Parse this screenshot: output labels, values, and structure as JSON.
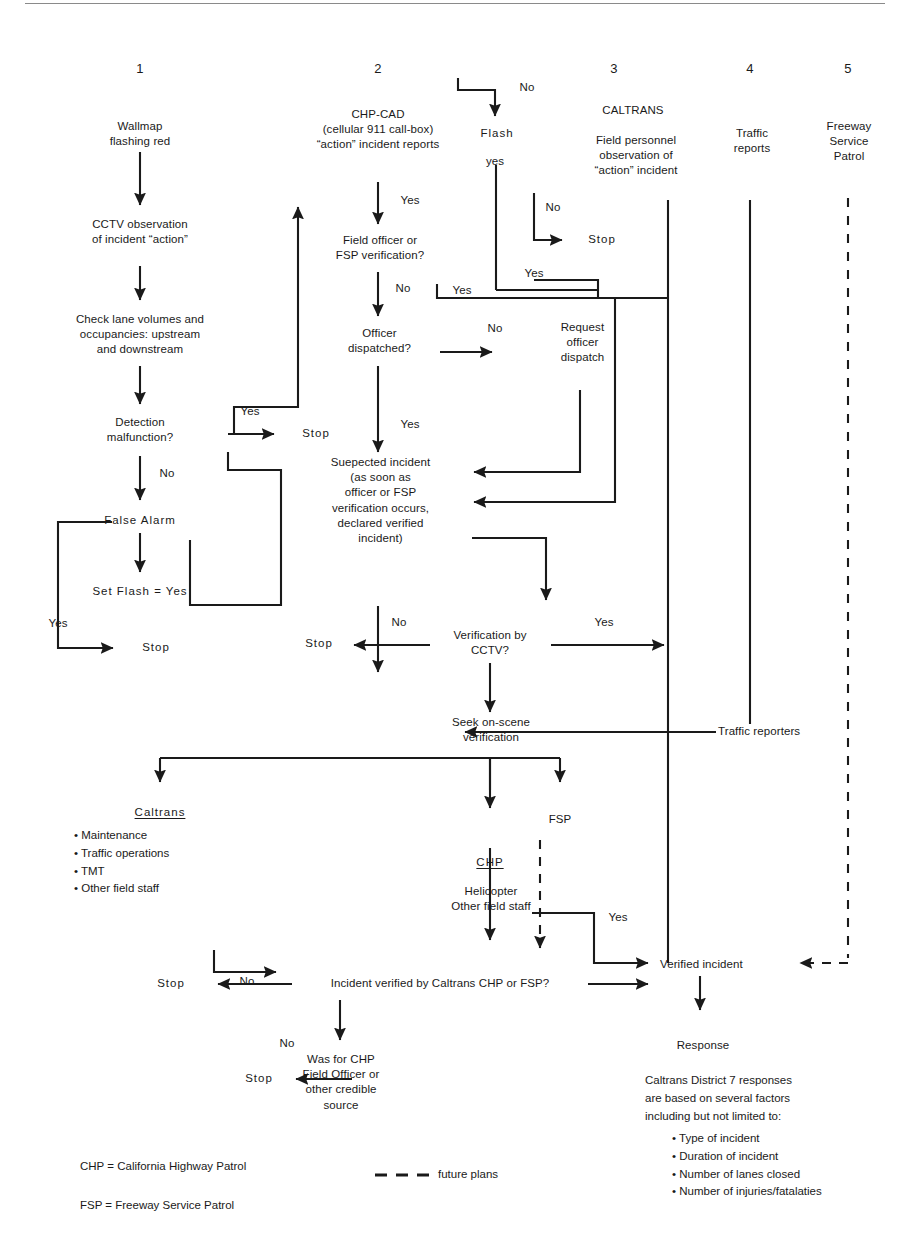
{
  "diagram": {
    "ink_color": "#1a1a1a",
    "rule_color": "#8a8a8a"
  },
  "columns": [
    {
      "number": "1",
      "header": "Wallmap\nflashing red"
    },
    {
      "number": "2",
      "header": "CHP-CAD\n(cellular 911 call-box)\n“action” incident reports"
    },
    {
      "number": "3",
      "header": "CALTRANS",
      "subheader": "Field personnel\nobservation of\n“action” incident"
    },
    {
      "number": "4",
      "header": "Traffic\nreports"
    },
    {
      "number": "5",
      "header": "Freeway\nService\nPatrol"
    }
  ],
  "nodes": {
    "wallmap": "Wallmap\nflashing red",
    "cctv_observation": "CCTV observation\nof incident “action”",
    "check_lanes": "Check lane volumes and\noccupancies: upstream\nand downstream",
    "detection_malfunction": "Detection\nmalfunction?",
    "false_alarm": "False Alarm",
    "set_flash_yes": "Set Flash = Yes",
    "stop_col1_top": "Stop",
    "stop_col1_bottom": "Stop",
    "chp_cad": "CHP-CAD\n(cellular 911 call-box)\n“action” incident reports",
    "field_officer_verification": "Field officer or\nFSP verification?",
    "officer_dispatched": "Officer\ndispatched?",
    "request_officer_dispatch": "Request\nofficer\ndispatch",
    "suspected_incident": "Suepected incident\n(as soon as\nofficer or FSP\nverification occurs,\ndeclared verified\nincident)",
    "verification_by_cctv": "Verification by\nCCTV?",
    "stop_cctv_no": "Stop",
    "flash": "Flash",
    "stop_flash_no": "Stop",
    "caltrans_header": "CALTRANS",
    "field_personnel": "Field personnel\nobservation of\n“action” incident",
    "traffic_reports": "Traffic\nreports",
    "traffic_reporters": "Traffic reporters",
    "freeway_service_patrol": "Freeway\nService\nPatrol",
    "seek_onscene": "Seek on-scene\nverification",
    "caltrans_branch": "Caltrans",
    "caltrans_branch_items": "• Maintenance\n• Traffic operations\n• TMT\n• Other field staff",
    "chp_branch": "CHP",
    "chp_branch_items": "Helicopter\nOther field staff",
    "fsp_branch": "FSP",
    "incident_verified_q": "Incident verified by Caltrans CHP or FSP?",
    "stop_incident_no": "Stop",
    "was_for_chp": "Was for CHP\nField Officer or\nother credible\nsource",
    "stop_was_for_chp_no": "Stop",
    "verified_incident": "Verified incident",
    "response": "Response"
  },
  "edge_labels": {
    "yes_detection": "Yes",
    "no_detection": "No",
    "yes_false_alarm_loop": "Yes",
    "yes_chp_cad": "Yes",
    "no_field_officer": "No",
    "no_officer_dispatched": "No",
    "yes_officer_dispatched": "Yes",
    "no_cctv": "No",
    "yes_cctv": "Yes",
    "no_flash": "No",
    "yes_flash": "yes",
    "no_field_personnel": "No",
    "yes_field_personnel": "Yes",
    "yes_cad_to_caltrans": "Yes",
    "yes_chp_to_verified": "Yes",
    "no_incident_verified": "No",
    "no_was_for_chp": "No"
  },
  "notes": {
    "district_note": "Caltrans District 7 responses\nare based on several factors\n including but not limited to:",
    "district_bullets": "• Type of incident\n• Duration of incident\n• Number of lanes closed\n• Number of injuries/fatalaties"
  },
  "legend": {
    "chp": "CHP = California Highway Patrol",
    "fsp": "FSP = Freeway Service Patrol",
    "future_plans": "future plans",
    "future_plans_icon": "dashed-line-swatch"
  }
}
